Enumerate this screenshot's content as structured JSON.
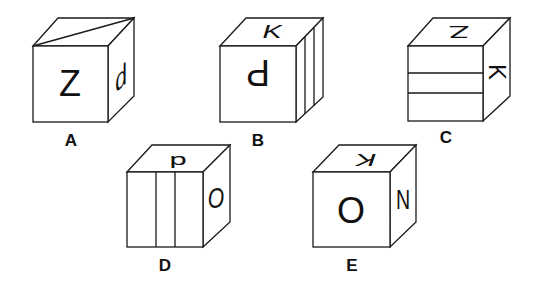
{
  "figure": {
    "colors": {
      "stroke": "#1a1a1a",
      "face": "#ffffff"
    }
  },
  "cubes": [
    {
      "label": "A",
      "front": {
        "mark": "Z",
        "rotation": 0
      },
      "top": {
        "mark": "diagonal line"
      },
      "right": {
        "mark": "d",
        "rotation": 0
      }
    },
    {
      "label": "B",
      "front": {
        "mark": "P",
        "rotation": 180
      },
      "top": {
        "mark": "K",
        "rotation": 0
      },
      "right": {
        "mark": "two vertical lines"
      }
    },
    {
      "label": "C",
      "front": {
        "mark": "two horizontal lines"
      },
      "top": {
        "mark": "Z",
        "rotation": 180
      },
      "right": {
        "mark": "K",
        "rotation": 90
      }
    },
    {
      "label": "D",
      "front": {
        "mark": "two vertical lines"
      },
      "top": {
        "mark": "d",
        "rotation": 180
      },
      "right": {
        "mark": "O",
        "rotation": 0
      }
    },
    {
      "label": "E",
      "front": {
        "mark": "O",
        "rotation": 0
      },
      "top": {
        "mark": "K",
        "rotation": 180
      },
      "right": {
        "mark": "N",
        "rotation": 0
      }
    }
  ]
}
